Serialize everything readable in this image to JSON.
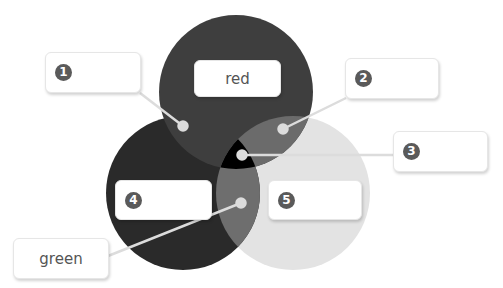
{
  "diagram": {
    "type": "venn",
    "circles": [
      {
        "id": "top",
        "name": "red",
        "cx": 236,
        "cy": 92,
        "r": 77,
        "color": "#3e3e3e"
      },
      {
        "id": "left",
        "name": "green",
        "cx": 183,
        "cy": 193,
        "r": 77,
        "color": "#2a2a2a"
      },
      {
        "id": "right",
        "name": "",
        "cx": 293,
        "cy": 193,
        "r": 77,
        "color": "#e3e3e3"
      }
    ],
    "region_colors": {
      "top_right_overlap": "#6b6b6b",
      "center_overlap": "#000000",
      "left_right_overlap": "#6e6e6e"
    },
    "labels": [
      {
        "id": "box-1",
        "badge": "1",
        "text": "",
        "x": 45,
        "y": 52,
        "w": 96,
        "h": 41,
        "dot": [
          183,
          126
        ],
        "anchor": [
          140,
          93
        ]
      },
      {
        "id": "box-2",
        "badge": "2",
        "text": "",
        "x": 345,
        "y": 58,
        "w": 94,
        "h": 41,
        "dot": [
          283,
          129
        ],
        "anchor": [
          346,
          98
        ]
      },
      {
        "id": "box-3",
        "badge": "3",
        "text": "",
        "x": 393,
        "y": 131,
        "w": 95,
        "h": 41,
        "dot": [
          242,
          155
        ],
        "anchor": [
          393,
          155
        ]
      },
      {
        "id": "box-4",
        "badge": "4",
        "text": "",
        "x": 115,
        "y": 180,
        "w": 97,
        "h": 40,
        "dot": null,
        "anchor": null
      },
      {
        "id": "box-5",
        "badge": "5",
        "text": "",
        "x": 268,
        "y": 180,
        "w": 94,
        "h": 40,
        "dot": null,
        "anchor": null
      },
      {
        "id": "box-red",
        "badge": "",
        "text": "red",
        "x": 194,
        "y": 60,
        "w": 87,
        "h": 37,
        "dot": null,
        "anchor": null
      },
      {
        "id": "box-green",
        "badge": "",
        "text": "green",
        "x": 13,
        "y": 238,
        "w": 96,
        "h": 41,
        "dot": [
          241,
          203
        ],
        "anchor": [
          108,
          256
        ]
      }
    ],
    "line_color": "#dcdcdc"
  }
}
